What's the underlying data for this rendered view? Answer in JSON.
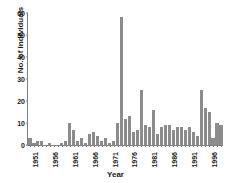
{
  "chart_data": {
    "type": "bar",
    "title": "",
    "xlabel": "Year",
    "ylabel": "No. of Individuals",
    "ylim": [
      0,
      60
    ],
    "yticks": [
      0,
      10,
      20,
      30,
      40,
      50,
      60
    ],
    "xticks": [
      1951,
      1956,
      1961,
      1966,
      1971,
      1976,
      1981,
      1986,
      1991,
      1996
    ],
    "grid": false,
    "legend": null,
    "bar_color": "#8c8c8c",
    "categories": [
      1951,
      1952,
      1953,
      1954,
      1955,
      1956,
      1957,
      1958,
      1959,
      1960,
      1961,
      1962,
      1963,
      1964,
      1965,
      1966,
      1967,
      1968,
      1969,
      1970,
      1971,
      1972,
      1973,
      1974,
      1975,
      1976,
      1977,
      1978,
      1979,
      1980,
      1981,
      1982,
      1983,
      1984,
      1985,
      1986,
      1987,
      1988,
      1989,
      1990,
      1991,
      1992,
      1993,
      1994,
      1995,
      1996,
      1997,
      1998,
      1999
    ],
    "values": [
      3,
      1,
      2,
      2,
      0,
      1,
      0,
      0,
      1,
      2,
      10,
      7,
      2,
      3,
      1,
      5,
      6,
      4,
      2,
      3,
      1,
      2,
      10,
      58,
      12,
      13,
      6,
      7,
      25,
      9,
      8,
      16,
      5,
      8,
      9,
      9,
      7,
      8,
      8,
      7,
      8,
      6,
      4,
      25,
      17,
      15,
      3,
      10,
      9
    ]
  }
}
